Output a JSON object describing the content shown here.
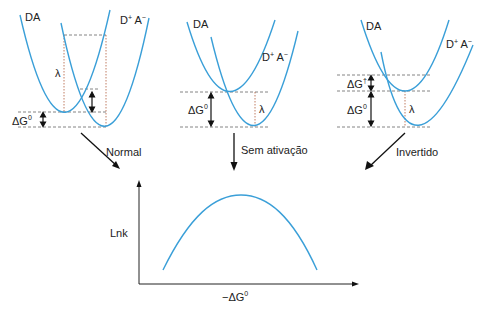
{
  "colors": {
    "curve": "#3a9fd8",
    "text": "#222222",
    "arrow": "#111111",
    "dashed": "#666666"
  },
  "panels": [
    {
      "name": "normal",
      "reactant_label": "DA",
      "product_label_base_d": "D",
      "product_label_sup_plus": "+",
      "product_label_base_a": " A",
      "product_label_sup_minus": "−",
      "lambda_label": "λ",
      "dg0_label": "ΔG",
      "dg0_sup": "0",
      "arrow_label": "Normal"
    },
    {
      "name": "sem-ativacao",
      "reactant_label": "DA",
      "product_label_base_d": "D",
      "product_label_sup_plus": "+",
      "product_label_base_a": " A",
      "product_label_sup_minus": "−",
      "lambda_label": "λ",
      "dg0_label": "ΔG",
      "dg0_sup": "0",
      "arrow_label": "Sem ativação"
    },
    {
      "name": "invertido",
      "reactant_label": "DA",
      "product_label_base_d": "D",
      "product_label_sup_plus": "+",
      "product_label_base_a": " A",
      "product_label_sup_minus": "−",
      "lambda_label": "λ",
      "dg0_label": "ΔG",
      "dg0_sup": "0",
      "dgdagger_label": "ΔG",
      "dgdagger_sup": "†",
      "arrow_label": "Invertido"
    }
  ],
  "plot": {
    "ylabel": "Lnk",
    "xlabel_prefix": "−ΔG",
    "xlabel_sup": "0",
    "curve_shape": "inverted-parabola"
  }
}
